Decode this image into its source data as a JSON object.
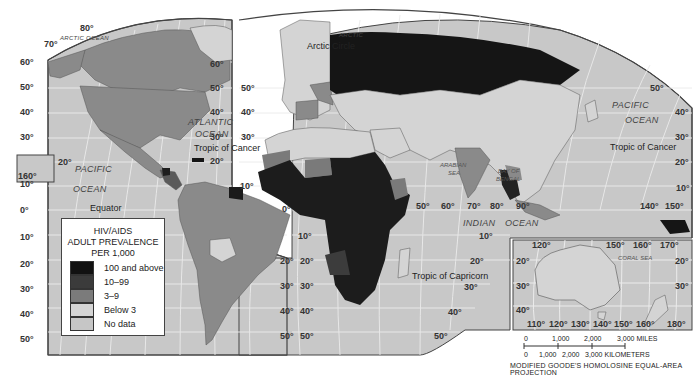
{
  "map": {
    "title": "HIV/AIDS Adult Prevalence per 1,000",
    "projection": "MODIFIED GOODE'S HOMOLOSINE EQUAL-AREA PROJECTION",
    "colors": {
      "ocean": "#c8c8c8",
      "graticule": "#ececec",
      "cat_100_above": "#1a1a1a",
      "cat_10_99": "#3a3a3a",
      "cat_3_9": "#7a7a7a",
      "cat_below_3": "#d2d2d2",
      "cat_no_data": "#bdbdbd",
      "border": "#444444"
    }
  },
  "legend": {
    "title_line1": "HIV/AIDS",
    "title_line2": "ADULT PREVALENCE",
    "title_line3": "PER 1,000",
    "items": [
      {
        "label": "100 and above",
        "color": "#111111"
      },
      {
        "label": "10–99",
        "color": "#3b3b3b"
      },
      {
        "label": "3–9",
        "color": "#7b7b7b"
      },
      {
        "label": "Below 3",
        "color": "#d4d4d4"
      },
      {
        "label": "No data",
        "color": "#c6c6c6"
      }
    ]
  },
  "oceans": {
    "arctic_left": "ARCTIC OCEAN",
    "arctic_right": "ARCTIC",
    "arctic_right2": "OCEAN",
    "atlantic1": "ATLANTIC",
    "atlantic2": "OCEAN",
    "pacific_left1": "PACIFIC",
    "pacific_left2": "OCEAN",
    "pacific_right1": "PACIFIC",
    "pacific_right2": "OCEAN",
    "indian": "INDIAN",
    "indian_ocean": "OCEAN",
    "arabian1": "ARABIAN",
    "arabian2": "SEA",
    "bengal1": "BAY OF",
    "bengal2": "BENGAL",
    "coral": "CORAL SEA"
  },
  "lines": {
    "arctic_circle": "Arctic Circle",
    "tropic_cancer_left": "Tropic of Cancer",
    "tropic_cancer_right": "Tropic of Cancer",
    "equator": "Equator",
    "tropic_capricorn": "Tropic of Capricorn"
  },
  "degrees": {
    "left_lat": [
      "60°",
      "50°",
      "40°",
      "30°",
      "10°",
      "0°",
      "10°",
      "20°",
      "30°",
      "40°",
      "50°"
    ],
    "top": [
      "80°",
      "70°"
    ],
    "hawaii": [
      "20°",
      "160°"
    ],
    "atl_right_lat": [
      "60°",
      "50°",
      "40°",
      "30°",
      "20°",
      "10°"
    ],
    "euro_left_lat": [
      "50°",
      "40°",
      "30°"
    ],
    "sa_right_lat": [
      "20°",
      "30°",
      "40°",
      "50°"
    ],
    "af_left_lat": [
      "0°",
      "10°",
      "20°",
      "30°",
      "40°",
      "50°"
    ],
    "indian_lon": [
      "50°",
      "60°",
      "70°",
      "80°",
      "90°"
    ],
    "indian_lat": [
      "10°",
      "20°",
      "30°",
      "40°",
      "50°"
    ],
    "asia_right_lat": [
      "50°",
      "40°",
      "30°",
      "20°",
      "10°"
    ],
    "asia_lon": [
      "140°",
      "150°"
    ],
    "aus_top": [
      "120°",
      "150°",
      "160°",
      "170°"
    ],
    "aus_lat_left": [
      "20°",
      "30°",
      "40°"
    ],
    "aus_lat_right": [
      "20°",
      "30°"
    ],
    "aus_bottom": [
      "110°",
      "120°",
      "130°",
      "140°",
      "150°",
      "160°",
      "180°"
    ]
  },
  "scale": {
    "miles": [
      "0",
      "1,000",
      "2,000",
      "3,000 MILES"
    ],
    "km": [
      "0",
      "1,000",
      "2,000",
      "3,000 KILOMETERS"
    ]
  }
}
